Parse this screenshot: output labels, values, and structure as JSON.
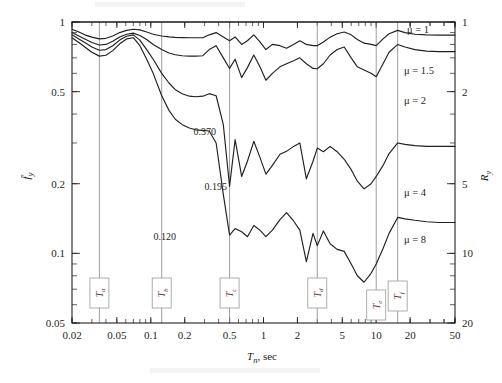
{
  "figure": {
    "name": "strength-reduction-factor-chart",
    "left_axis_label": "f̄y",
    "right_axis_label": "Ry",
    "x_axis_label": "Tn, sec"
  },
  "chart_data": {
    "type": "line",
    "title": "",
    "subtitle": "",
    "xlabel": "Tn, sec",
    "ylabel": "f̄y",
    "y2label": "Ry",
    "xscale": "log",
    "yscale": "log",
    "xlim": [
      0.02,
      50
    ],
    "ylim": [
      0.05,
      1
    ],
    "y2lim": [
      20,
      1
    ],
    "grid": false,
    "legend_position": "inline-right",
    "xticks": [
      0.02,
      0.05,
      0.1,
      0.2,
      0.5,
      1,
      2,
      5,
      10,
      20,
      50
    ],
    "xticklabels": [
      "0.02",
      "0.05",
      "0.1",
      "0.2",
      "0.5",
      "1",
      "2",
      "5",
      "10",
      "20",
      "50"
    ],
    "yticks": [
      1,
      0.5,
      0.2,
      0.1,
      0.05
    ],
    "yticklabels": [
      "1",
      "0.5",
      "0.2",
      "0.1",
      "0.05"
    ],
    "y2ticks": [
      1,
      2,
      5,
      10,
      20
    ],
    "y2ticklabels": [
      "1",
      "2",
      "5",
      "10",
      "20"
    ],
    "annotations": [
      {
        "text": "0.370",
        "x": 0.5,
        "y": 0.37,
        "series": "μ = 2"
      },
      {
        "text": "0.195",
        "x": 0.5,
        "y": 0.195,
        "series": "μ = 4"
      },
      {
        "text": "0.120",
        "x": 0.5,
        "y": 0.12,
        "series": "μ = 8"
      }
    ],
    "period_markers": [
      {
        "label": "Ta",
        "sub": "a",
        "x": 0.035
      },
      {
        "label": "Tb",
        "sub": "b",
        "x": 0.125
      },
      {
        "label": "Tc",
        "sub": "c",
        "x": 0.5
      },
      {
        "label": "Td",
        "sub": "d",
        "x": 3.0
      },
      {
        "label": "Te",
        "sub": "e",
        "x": 10.0
      },
      {
        "label": "Tf",
        "sub": "f",
        "x": 15.5
      }
    ],
    "series": [
      {
        "name": "μ = 1",
        "label": "μ = 1",
        "mu": 1,
        "x": [
          0.02,
          50
        ],
        "values": [
          1.0,
          1.0
        ]
      },
      {
        "name": "μ = 1.5",
        "label": "μ = 1.5",
        "mu": 1.5,
        "x": [
          0.02,
          0.023,
          0.026,
          0.03,
          0.035,
          0.04,
          0.046,
          0.053,
          0.061,
          0.07,
          0.08,
          0.092,
          0.105,
          0.125,
          0.145,
          0.165,
          0.19,
          0.22,
          0.25,
          0.29,
          0.33,
          0.38,
          0.44,
          0.5,
          0.56,
          0.64,
          0.72,
          0.82,
          0.93,
          1.05,
          1.2,
          1.4,
          1.6,
          1.85,
          2.1,
          2.4,
          2.75,
          3.0,
          3.4,
          3.9,
          4.5,
          5.2,
          6.0,
          6.8,
          7.8,
          9.0,
          10.0,
          11.5,
          13.0,
          15.5,
          18.0,
          22.0,
          28.0,
          36.0,
          50.0
        ],
        "values": [
          0.93,
          0.905,
          0.88,
          0.86,
          0.845,
          0.85,
          0.87,
          0.9,
          0.92,
          0.93,
          0.925,
          0.905,
          0.885,
          0.87,
          0.862,
          0.858,
          0.856,
          0.855,
          0.855,
          0.855,
          0.88,
          0.9,
          0.862,
          0.83,
          0.862,
          0.8,
          0.83,
          0.88,
          0.82,
          0.76,
          0.8,
          0.79,
          0.77,
          0.8,
          0.83,
          0.8,
          0.79,
          0.79,
          0.82,
          0.86,
          0.89,
          0.905,
          0.88,
          0.84,
          0.81,
          0.8,
          0.79,
          0.845,
          0.89,
          0.92,
          0.9,
          0.885,
          0.88,
          0.878,
          0.878
        ]
      },
      {
        "name": "μ = 2",
        "label": "μ = 2",
        "mu": 2,
        "x": [
          0.02,
          0.023,
          0.026,
          0.03,
          0.035,
          0.04,
          0.046,
          0.053,
          0.061,
          0.07,
          0.08,
          0.092,
          0.105,
          0.125,
          0.145,
          0.165,
          0.19,
          0.22,
          0.25,
          0.29,
          0.33,
          0.38,
          0.44,
          0.5,
          0.56,
          0.64,
          0.72,
          0.82,
          0.93,
          1.05,
          1.2,
          1.4,
          1.6,
          1.85,
          2.1,
          2.4,
          2.75,
          3.0,
          3.4,
          3.9,
          4.5,
          5.2,
          6.0,
          6.8,
          7.8,
          9.0,
          10.0,
          11.5,
          13.0,
          15.5,
          18.0,
          22.0,
          28.0,
          36.0,
          50.0
        ],
        "values": [
          0.9,
          0.87,
          0.845,
          0.815,
          0.795,
          0.8,
          0.825,
          0.862,
          0.885,
          0.895,
          0.875,
          0.84,
          0.8,
          0.76,
          0.735,
          0.722,
          0.715,
          0.712,
          0.712,
          0.715,
          0.76,
          0.79,
          0.7,
          0.63,
          0.69,
          0.575,
          0.635,
          0.72,
          0.64,
          0.56,
          0.6,
          0.64,
          0.66,
          0.68,
          0.7,
          0.66,
          0.63,
          0.628,
          0.66,
          0.72,
          0.76,
          0.78,
          0.7,
          0.64,
          0.62,
          0.6,
          0.58,
          0.66,
          0.74,
          0.8,
          0.78,
          0.76,
          0.748,
          0.745,
          0.745
        ]
      },
      {
        "name": "μ = 4",
        "label": "μ = 4",
        "mu": 4,
        "x": [
          0.02,
          0.023,
          0.026,
          0.03,
          0.035,
          0.04,
          0.046,
          0.053,
          0.061,
          0.07,
          0.08,
          0.092,
          0.105,
          0.125,
          0.145,
          0.165,
          0.19,
          0.22,
          0.25,
          0.29,
          0.33,
          0.38,
          0.44,
          0.5,
          0.56,
          0.64,
          0.72,
          0.82,
          0.93,
          1.05,
          1.2,
          1.4,
          1.6,
          1.85,
          2.1,
          2.4,
          2.75,
          3.0,
          3.4,
          3.9,
          4.5,
          5.2,
          6.0,
          6.8,
          7.8,
          9.0,
          10.0,
          11.5,
          13.0,
          15.5,
          18.0,
          22.0,
          28.0,
          36.0,
          50.0
        ],
        "values": [
          0.88,
          0.845,
          0.815,
          0.78,
          0.755,
          0.76,
          0.79,
          0.835,
          0.868,
          0.88,
          0.835,
          0.76,
          0.69,
          0.6,
          0.545,
          0.51,
          0.49,
          0.478,
          0.475,
          0.478,
          0.49,
          0.48,
          0.36,
          0.195,
          0.31,
          0.215,
          0.25,
          0.305,
          0.26,
          0.22,
          0.24,
          0.268,
          0.276,
          0.29,
          0.3,
          0.21,
          0.25,
          0.285,
          0.275,
          0.29,
          0.275,
          0.255,
          0.23,
          0.205,
          0.19,
          0.2,
          0.215,
          0.24,
          0.27,
          0.3,
          0.296,
          0.292,
          0.29,
          0.29,
          0.29
        ]
      },
      {
        "name": "μ = 8",
        "label": "μ = 8",
        "mu": 8,
        "x": [
          0.02,
          0.023,
          0.026,
          0.03,
          0.035,
          0.04,
          0.046,
          0.053,
          0.061,
          0.07,
          0.08,
          0.092,
          0.105,
          0.125,
          0.145,
          0.165,
          0.19,
          0.22,
          0.25,
          0.29,
          0.33,
          0.38,
          0.44,
          0.5,
          0.56,
          0.64,
          0.72,
          0.82,
          0.93,
          1.05,
          1.2,
          1.4,
          1.6,
          1.85,
          2.1,
          2.4,
          2.75,
          3.0,
          3.4,
          3.9,
          4.5,
          5.2,
          6.0,
          6.8,
          7.8,
          9.0,
          10.0,
          11.5,
          13.0,
          15.5,
          18.0,
          22.0,
          28.0,
          36.0,
          50.0
        ],
        "values": [
          0.855,
          0.815,
          0.78,
          0.74,
          0.712,
          0.718,
          0.752,
          0.805,
          0.845,
          0.855,
          0.79,
          0.69,
          0.6,
          0.48,
          0.415,
          0.38,
          0.36,
          0.348,
          0.342,
          0.34,
          0.338,
          0.3,
          0.18,
          0.12,
          0.128,
          0.124,
          0.118,
          0.132,
          0.126,
          0.118,
          0.126,
          0.14,
          0.15,
          0.138,
          0.126,
          0.092,
          0.122,
          0.108,
          0.125,
          0.11,
          0.104,
          0.102,
          0.09,
          0.08,
          0.075,
          0.082,
          0.09,
          0.105,
          0.122,
          0.143,
          0.141,
          0.139,
          0.137,
          0.136,
          0.136
        ]
      }
    ]
  }
}
